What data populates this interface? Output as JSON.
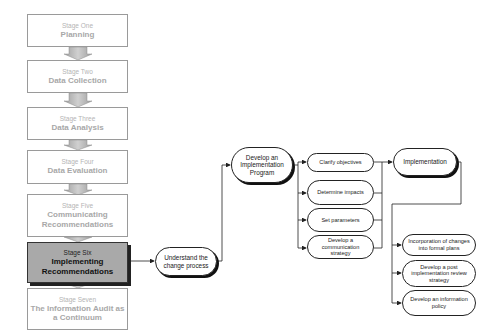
{
  "stages": [
    {
      "sub": "Stage One",
      "main": "Planning"
    },
    {
      "sub": "Stage Two",
      "main": "Data Collection"
    },
    {
      "sub": "Stage Three",
      "main": "Data Analysis"
    },
    {
      "sub": "Stage Four",
      "main": "Data Evaluation"
    },
    {
      "sub": "Stage Five",
      "main": "Communicating Recommendations"
    },
    {
      "sub": "Stage Six",
      "main": "Implementing Recommendations"
    },
    {
      "sub": "Stage Seven",
      "main": "The Information Audit as a Continuum"
    }
  ],
  "active_stage": "Stage Six",
  "process": {
    "understand": "Understand the change process",
    "develop_program": "Develop an Implementation Program",
    "program_steps": [
      "Clarify objectives",
      "Determine impacts",
      "Set parameters",
      "Develop a communication strategy"
    ],
    "implementation": "Implementation",
    "implementation_steps": [
      "Incorporation of changes into formal plans",
      "Develop a post implementation review strategy",
      "Develop an information policy"
    ]
  },
  "colors": {
    "inactive_text": "#a8a8a8",
    "active_fill": "#a9a9a9",
    "arrow_fill": "#b8b8b8",
    "line": "#222222"
  }
}
